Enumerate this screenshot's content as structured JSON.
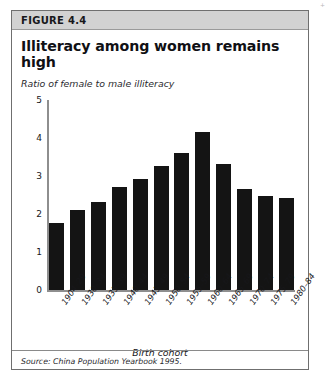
{
  "figure": {
    "label": "FIGURE 4.4",
    "title": "Illiteracy among women remains high",
    "subtitle": "Ratio of female to male illiteracy",
    "source": "Source: China Population Yearbook 1995.",
    "corner_mark": "+"
  },
  "chart_data": {
    "type": "bar",
    "title": "Illiteracy among women remains high",
    "subtitle": "Ratio of female to male illiteracy",
    "xlabel": "Birth cohort",
    "ylabel": "Ratio of female to male illiteracy",
    "categories": [
      "1904–29",
      "1930–34",
      "1935–39",
      "1940–44",
      "1945–49",
      "1950–54",
      "1955–59",
      "1960–64",
      "1965–69",
      "1970–74",
      "1975–79",
      "1980–84"
    ],
    "values": [
      1.75,
      2.1,
      2.3,
      2.7,
      2.9,
      3.25,
      3.6,
      4.15,
      3.3,
      2.65,
      2.45,
      2.4
    ],
    "ylim": [
      0,
      5
    ],
    "yticks": [
      0,
      1,
      2,
      3,
      4,
      5
    ],
    "ytick_labels": [
      "0",
      "1",
      "2",
      "3",
      "4",
      "5"
    ],
    "grid": false,
    "legend": null,
    "bar_color": "#141414",
    "axis_color": "#8e8e8e",
    "source": "Source: China Population Yearbook 1995."
  }
}
